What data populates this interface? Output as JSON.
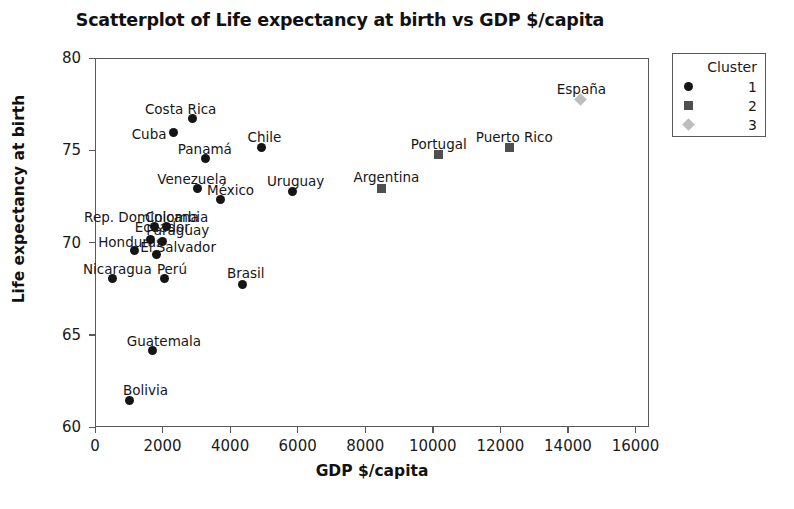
{
  "chart_data": {
    "type": "scatter",
    "title": "Scatterplot of Life expectancy at birth vs GDP $/capita",
    "xlabel": "GDP $/capita",
    "ylabel": "Life expectancy at birth",
    "xlim": [
      0,
      16400
    ],
    "ylim": [
      60,
      80
    ],
    "xticks": [
      0,
      2000,
      4000,
      6000,
      8000,
      10000,
      12000,
      14000,
      16000
    ],
    "xtick_labels": [
      "0",
      "2000",
      "4000",
      "6000",
      "8000",
      "10000",
      "12000",
      "14000",
      "16000"
    ],
    "yticks": [
      60,
      65,
      70,
      75,
      80
    ],
    "ytick_labels": [
      "60",
      "65",
      "70",
      "75",
      "80"
    ],
    "grid": false,
    "legend": {
      "title": "Cluster",
      "position": "outside-top-right",
      "entries": [
        {
          "label": "1",
          "marker": "circle",
          "color": "#151515"
        },
        {
          "label": "2",
          "marker": "square",
          "color": "#4f4f4f"
        },
        {
          "label": "3",
          "marker": "diamond",
          "color": "#bdbdbd"
        }
      ]
    },
    "points": [
      {
        "name": "Bolivia",
        "x": 980,
        "y": 61.5,
        "cluster": 1,
        "label_dx": -6,
        "label_dy": -16
      },
      {
        "name": "Guatemala",
        "x": 1680,
        "y": 64.2,
        "cluster": 1,
        "label_dx": -26,
        "label_dy": -16
      },
      {
        "name": "Nicaragua",
        "x": 500,
        "y": 68.1,
        "cluster": 1,
        "label_dx": -30,
        "label_dy": -16
      },
      {
        "name": "Honduras",
        "x": 1130,
        "y": 69.6,
        "cluster": 1,
        "label_dx": -36,
        "label_dy": -15
      },
      {
        "name": "El Salvador",
        "x": 1780,
        "y": 69.4,
        "cluster": 1,
        "label_dx": -16,
        "label_dy": -14
      },
      {
        "name": "Perú",
        "x": 2040,
        "y": 68.1,
        "cluster": 1,
        "label_dx": -8,
        "label_dy": -16
      },
      {
        "name": "Paraguay",
        "x": 1960,
        "y": 70.1,
        "cluster": 1,
        "label_dx": -16,
        "label_dy": -18
      },
      {
        "name": "Ecuador",
        "x": 1620,
        "y": 70.2,
        "cluster": 1,
        "label_dx": -16,
        "label_dy": -19
      },
      {
        "name": "Rep. Dominicana",
        "x": 1720,
        "y": 70.9,
        "cluster": 1,
        "label_dx": -70,
        "label_dy": -16
      },
      {
        "name": "Colombia",
        "x": 2100,
        "y": 70.9,
        "cluster": 1,
        "label_dx": -22,
        "label_dy": -16
      },
      {
        "name": "Brasil",
        "x": 4350,
        "y": 67.8,
        "cluster": 1,
        "label_dx": -16,
        "label_dy": -17
      },
      {
        "name": "México",
        "x": 3700,
        "y": 72.4,
        "cluster": 1,
        "label_dx": -14,
        "label_dy": -15
      },
      {
        "name": "Venezuela",
        "x": 3000,
        "y": 73.0,
        "cluster": 1,
        "label_dx": -40,
        "label_dy": -15
      },
      {
        "name": "Panamá",
        "x": 3250,
        "y": 74.6,
        "cluster": 1,
        "label_dx": -28,
        "label_dy": -16
      },
      {
        "name": "Uruguay",
        "x": 5830,
        "y": 72.8,
        "cluster": 1,
        "label_dx": -26,
        "label_dy": -17
      },
      {
        "name": "Chile",
        "x": 4900,
        "y": 75.2,
        "cluster": 1,
        "label_dx": -14,
        "label_dy": -17
      },
      {
        "name": "Cuba",
        "x": 2300,
        "y": 76.0,
        "cluster": 1,
        "label_dx": -42,
        "label_dy": -5
      },
      {
        "name": "Costa Rica",
        "x": 2870,
        "y": 76.8,
        "cluster": 1,
        "label_dx": -48,
        "label_dy": -15
      },
      {
        "name": "Argentina",
        "x": 8450,
        "y": 73.0,
        "cluster": 2,
        "label_dx": -28,
        "label_dy": -17
      },
      {
        "name": "Portugal",
        "x": 10150,
        "y": 74.8,
        "cluster": 2,
        "label_dx": -28,
        "label_dy": -17
      },
      {
        "name": "Puerto Rico",
        "x": 12250,
        "y": 75.2,
        "cluster": 2,
        "label_dx": -34,
        "label_dy": -17
      },
      {
        "name": "España",
        "x": 14350,
        "y": 77.8,
        "cluster": 3,
        "label_dx": -24,
        "label_dy": -17
      }
    ]
  }
}
